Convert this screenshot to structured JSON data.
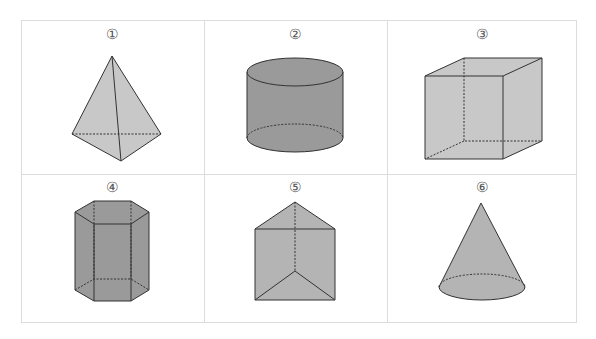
{
  "figures": [
    {
      "label": "①",
      "name": "triangular-pyramid"
    },
    {
      "label": "②",
      "name": "cylinder"
    },
    {
      "label": "③",
      "name": "cube"
    },
    {
      "label": "④",
      "name": "hexagonal-prism"
    },
    {
      "label": "⑤",
      "name": "triangular-prism"
    },
    {
      "label": "⑥",
      "name": "cone"
    }
  ],
  "colors": {
    "light_fill": "#c8c8c8",
    "dark_fill": "#9a9a9a",
    "mid_fill": "#b4b4b4",
    "edge": "#333333",
    "grid": "#dcdcdc"
  }
}
